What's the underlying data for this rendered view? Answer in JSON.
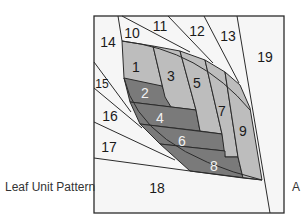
{
  "caption": "Leaf Unit Pattern",
  "corner_label": "A",
  "colors": {
    "background": "#f6f6f6",
    "light_gray": "#bdbdbd",
    "dark_gray": "#7a7a7a",
    "stroke": "#2b2b2b"
  },
  "pieces": [
    {
      "id": "1",
      "label": "1",
      "shade": "light_gray"
    },
    {
      "id": "2",
      "label": "2",
      "shade": "dark_gray"
    },
    {
      "id": "3",
      "label": "3",
      "shade": "light_gray"
    },
    {
      "id": "4",
      "label": "4",
      "shade": "dark_gray"
    },
    {
      "id": "5",
      "label": "5",
      "shade": "light_gray"
    },
    {
      "id": "6",
      "label": "6",
      "shade": "dark_gray"
    },
    {
      "id": "7",
      "label": "7",
      "shade": "light_gray"
    },
    {
      "id": "8",
      "label": "8",
      "shade": "dark_gray"
    },
    {
      "id": "9",
      "label": "9",
      "shade": "light_gray"
    },
    {
      "id": "10",
      "label": "10",
      "shade": "background"
    },
    {
      "id": "11",
      "label": "11",
      "shade": "background"
    },
    {
      "id": "12",
      "label": "12",
      "shade": "background"
    },
    {
      "id": "13",
      "label": "13",
      "shade": "background"
    },
    {
      "id": "14",
      "label": "14",
      "shade": "background"
    },
    {
      "id": "15",
      "label": "15",
      "shade": "background"
    },
    {
      "id": "16",
      "label": "16",
      "shade": "background"
    },
    {
      "id": "17",
      "label": "17",
      "shade": "background"
    },
    {
      "id": "18",
      "label": "18",
      "shade": "background"
    },
    {
      "id": "19",
      "label": "19",
      "shade": "background"
    }
  ]
}
